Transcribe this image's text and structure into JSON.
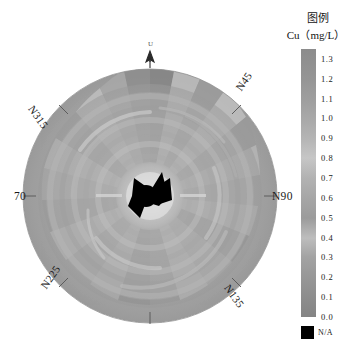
{
  "figure": {
    "kind": "polar-contour-map",
    "compass_labels": {
      "n45": "N45",
      "n90": "N90",
      "n135": "N135",
      "n225": "N225",
      "n270": "70",
      "n315": "N315",
      "up_arrow": "U"
    }
  },
  "legend": {
    "title": "图例",
    "subtitle": "Cu（mg/L）",
    "na_label": "N/A",
    "na_color": "#000000",
    "ticks": [
      "1.3",
      "1.2",
      "1.1",
      "1.0",
      "0.9",
      "0.8",
      "0.7",
      "0.6",
      "0.5",
      "0.4",
      "0.3",
      "0.2",
      "0.1",
      "0.0"
    ]
  },
  "chart_data": {
    "type": "heatmap",
    "title": "",
    "subtitle": "",
    "xlabel": "",
    "ylabel": "",
    "legend_position": "right",
    "grid": false,
    "value_label": "Cu (mg/L)",
    "value_range": [
      0.0,
      1.35
    ],
    "colormap": "grayscale-inverted",
    "colorbar_ticks": [
      1.3,
      1.2,
      1.1,
      1.0,
      0.9,
      0.8,
      0.7,
      0.6,
      0.5,
      0.4,
      0.3,
      0.2,
      0.1,
      0.0
    ],
    "colorbar_stops": [
      {
        "value": 1.35,
        "color": "#8c8c8c"
      },
      {
        "value": 1.3,
        "color": "#8f8f8f"
      },
      {
        "value": 1.2,
        "color": "#959595"
      },
      {
        "value": 1.1,
        "color": "#9e9e9e"
      },
      {
        "value": 1.0,
        "color": "#a8a8a8"
      },
      {
        "value": 0.9,
        "color": "#b4b4b4"
      },
      {
        "value": 0.8,
        "color": "#c6c6c6"
      },
      {
        "value": 0.7,
        "color": "#b2b2b2"
      },
      {
        "value": 0.6,
        "color": "#a6a6a6"
      },
      {
        "value": 0.5,
        "color": "#9b9b9b"
      },
      {
        "value": 0.4,
        "color": "#bdbdbd"
      },
      {
        "value": 0.3,
        "color": "#a3a3a3"
      },
      {
        "value": 0.2,
        "color": "#979797"
      },
      {
        "value": 0.1,
        "color": "#8d8d8d"
      },
      {
        "value": 0.0,
        "color": "#848484"
      }
    ],
    "angular_axis": {
      "units": "degrees-azimuth",
      "tick_labels": [
        "U",
        "N45",
        "N90",
        "N135",
        "N225",
        "70",
        "N315"
      ],
      "tick_angles_deg": [
        0,
        45,
        90,
        135,
        225,
        270,
        315
      ]
    },
    "radial_axis": {
      "center_is_origin": true,
      "na_region_at_center": true
    },
    "sector_values_outer_rim": [
      1.05,
      0.82,
      1.18,
      0.74,
      0.95,
      1.22,
      0.68,
      0.88,
      1.1,
      0.79,
      0.92,
      1.25,
      0.71,
      0.86,
      1.02,
      0.77,
      0.9,
      1.15,
      0.73,
      0.97,
      1.08,
      0.8,
      0.93,
      1.2,
      0.7,
      0.89,
      1.12,
      0.76,
      0.94,
      1.06,
      0.72,
      0.85
    ]
  }
}
